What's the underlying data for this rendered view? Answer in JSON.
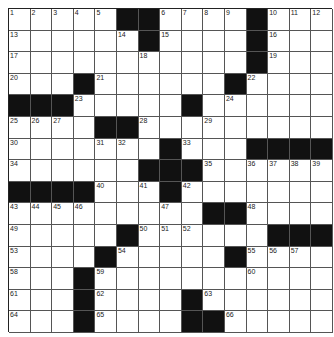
{
  "puzzle": {
    "size": 15,
    "rows": [
      ".....##....#...",
      "......#....#...",
      "...........#...",
      "...#......#....",
      "###.....#......",
      "....##.........",
      ".......#...####",
      "......###......",
      "####...#.......",
      ".........##....",
      ".....#......###",
      "....#.....#....",
      "...#...........",
      "...#....#......",
      "...#....##....."
    ],
    "numbers": [
      [
        0,
        0,
        1
      ],
      [
        0,
        1,
        2
      ],
      [
        0,
        2,
        3
      ],
      [
        0,
        3,
        4
      ],
      [
        0,
        4,
        5
      ],
      [
        0,
        7,
        6
      ],
      [
        0,
        8,
        7
      ],
      [
        0,
        9,
        8
      ],
      [
        0,
        10,
        9
      ],
      [
        0,
        12,
        10
      ],
      [
        0,
        13,
        11
      ],
      [
        0,
        14,
        12
      ],
      [
        1,
        0,
        13
      ],
      [
        1,
        5,
        14
      ],
      [
        1,
        7,
        15
      ],
      [
        1,
        12,
        16
      ],
      [
        2,
        0,
        17
      ],
      [
        2,
        6,
        18
      ],
      [
        2,
        12,
        19
      ],
      [
        3,
        0,
        20
      ],
      [
        3,
        4,
        21
      ],
      [
        3,
        11,
        22
      ],
      [
        4,
        3,
        23
      ],
      [
        4,
        10,
        24
      ],
      [
        5,
        0,
        25
      ],
      [
        5,
        1,
        26
      ],
      [
        5,
        2,
        27
      ],
      [
        5,
        6,
        28
      ],
      [
        5,
        9,
        29
      ],
      [
        6,
        0,
        30
      ],
      [
        6,
        4,
        31
      ],
      [
        6,
        5,
        32
      ],
      [
        6,
        8,
        33
      ],
      [
        7,
        0,
        34
      ],
      [
        7,
        9,
        35
      ],
      [
        7,
        11,
        36
      ],
      [
        7,
        12,
        37
      ],
      [
        7,
        13,
        38
      ],
      [
        7,
        14,
        39
      ],
      [
        8,
        4,
        40
      ],
      [
        8,
        6,
        41
      ],
      [
        8,
        8,
        42
      ],
      [
        9,
        0,
        43
      ],
      [
        9,
        1,
        44
      ],
      [
        9,
        2,
        45
      ],
      [
        9,
        3,
        46
      ],
      [
        9,
        7,
        47
      ],
      [
        9,
        11,
        48
      ],
      [
        10,
        0,
        49
      ],
      [
        10,
        6,
        50
      ],
      [
        10,
        7,
        51
      ],
      [
        10,
        8,
        52
      ],
      [
        11,
        0,
        53
      ],
      [
        11,
        5,
        54
      ],
      [
        11,
        11,
        55
      ],
      [
        11,
        12,
        56
      ],
      [
        11,
        13,
        57
      ],
      [
        12,
        0,
        58
      ],
      [
        12,
        4,
        59
      ],
      [
        12,
        11,
        60
      ],
      [
        13,
        0,
        61
      ],
      [
        13,
        4,
        62
      ],
      [
        13,
        9,
        63
      ],
      [
        14,
        0,
        64
      ],
      [
        14,
        4,
        65
      ],
      [
        14,
        10,
        66
      ]
    ]
  }
}
